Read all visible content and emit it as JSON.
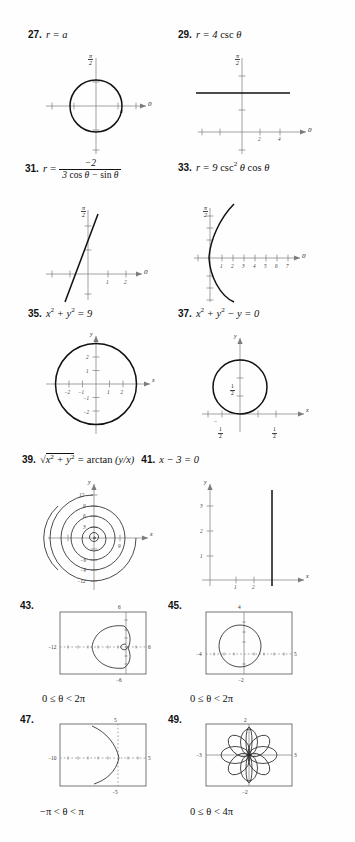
{
  "page": {
    "background": "#fefefe",
    "ink": "#111111"
  },
  "problems": [
    {
      "number": "27.",
      "equation_plain": "r = a",
      "graph_kind": "polar-circle",
      "axis_label_polar": "0",
      "axis_label_vertical": "π/2",
      "point_label": "a"
    },
    {
      "number": "29.",
      "equation_plain": "r = 4 csc θ",
      "graph_kind": "polar-horizontal-line",
      "axis_label_polar": "0",
      "axis_label_vertical": "π/2",
      "tick_labels": [
        "2",
        "4"
      ]
    },
    {
      "number": "31.",
      "equation_plain": "r = -2 / (3 cos θ - sin θ)",
      "numerator": "−2",
      "denominator": "3 cos θ − sin θ",
      "graph_kind": "polar-slanted-line",
      "axis_label_polar": "0",
      "axis_label_vertical": "π/2",
      "tick_labels": [
        "1",
        "2"
      ]
    },
    {
      "number": "33.",
      "equation_plain": "r = 9 csc² θ cos θ",
      "graph_kind": "polar-parabola",
      "axis_label_polar": "0",
      "axis_label_vertical": "π/2",
      "tick_labels": [
        "1",
        "2",
        "3",
        "4",
        "5",
        "6",
        "7"
      ]
    },
    {
      "number": "35.",
      "equation_plain": "x² + y² = 9",
      "graph_kind": "cartesian-circle",
      "axis_label_x": "x",
      "axis_label_y": "y",
      "x_tick_labels": [
        "−2",
        "−1",
        "1",
        "2"
      ],
      "y_tick_labels": [
        "2",
        "1",
        "−1",
        "−2"
      ],
      "radius": 3
    },
    {
      "number": "37.",
      "equation_plain": "x² + y² − y = 0",
      "graph_kind": "cartesian-circle-offset",
      "axis_label_x": "x",
      "axis_label_y": "y",
      "x_tick_labels": [
        "−1/2",
        "1/2"
      ],
      "y_tick_labels": [
        "1/2"
      ],
      "radius": 0.5,
      "center_y": 0.5
    },
    {
      "number": "39.",
      "equation_plain": "√(x² + y²) = arctan (y/x)",
      "graph_kind": "spiral",
      "axis_label_x": "x",
      "axis_label_y": "y",
      "y_tick_labels": [
        "12",
        "9",
        "6",
        "3",
        "−6",
        "−9",
        "−12"
      ],
      "x_tick_labels": [
        "9"
      ]
    },
    {
      "number": "41.",
      "equation_plain": "x − 3 = 0",
      "graph_kind": "cartesian-vertical-line",
      "axis_label_x": "x",
      "axis_label_y": "y",
      "x_tick_labels": [
        "1",
        "2"
      ],
      "y_tick_labels": [
        "1",
        "2",
        "3"
      ],
      "line_at_x": 3
    },
    {
      "number": "43.",
      "graph_kind": "calculator-limacon",
      "window": {
        "xmin": "−12",
        "xmax": "6",
        "ymin": "−6",
        "ymax": "6"
      },
      "condition": "0 ≤ θ < 2π"
    },
    {
      "number": "45.",
      "graph_kind": "calculator-circle",
      "window": {
        "xmin": "−4",
        "xmax": "5",
        "ymin": "−2",
        "ymax": "4"
      },
      "condition": "0 ≤ θ < 2π"
    },
    {
      "number": "47.",
      "graph_kind": "calculator-parabola",
      "window": {
        "xmin": "−10",
        "xmax": "5",
        "ymin": "−5",
        "ymax": "5"
      },
      "condition": "−π < θ < π"
    },
    {
      "number": "49.",
      "graph_kind": "calculator-rose",
      "window": {
        "xmin": "−3",
        "xmax": "3",
        "ymin": "−2",
        "ymax": "2"
      },
      "condition": "0 ≤ θ < 4π",
      "petals": 8
    }
  ]
}
